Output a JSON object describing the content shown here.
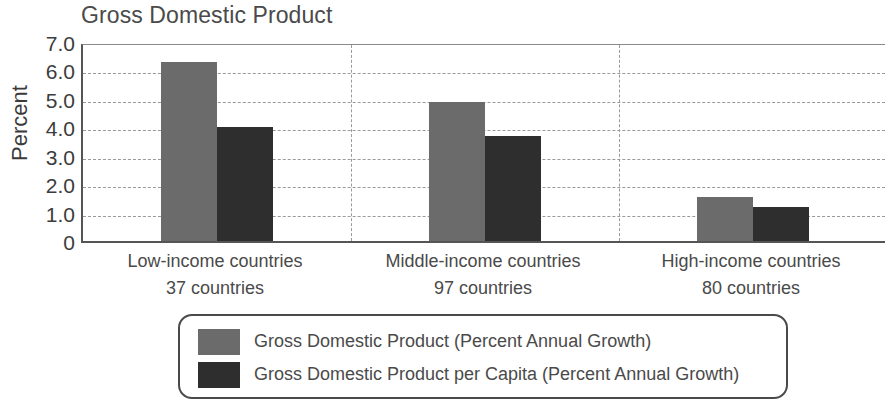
{
  "chart_data": {
    "type": "bar",
    "title": "Gross Domestic Product",
    "xlabel": "",
    "ylabel": "Percent",
    "ylim": [
      0,
      7.0
    ],
    "yticks": [
      "0",
      "1.0",
      "2.0",
      "3.0",
      "4.0",
      "5.0",
      "6.0",
      "7.0"
    ],
    "ytick_values": [
      0,
      1.0,
      2.0,
      3.0,
      4.0,
      5.0,
      6.0,
      7.0
    ],
    "grid": "horizontal-dashed",
    "legend_position": "bottom",
    "categories": [
      "Low-income countries",
      "Middle-income countries",
      "High-income countries"
    ],
    "category_sublabels": [
      "37 countries",
      "97 countries",
      "80 countries"
    ],
    "series": [
      {
        "name": "Gross Domestic Product (Percent Annual Growth)",
        "color": "#6b6b6b",
        "values": [
          6.3,
          4.9,
          1.55
        ]
      },
      {
        "name": "Gross Domestic Product per Capita (Percent Annual Growth)",
        "color": "#2e2e2e",
        "values": [
          4.0,
          3.7,
          1.2
        ]
      }
    ]
  },
  "legend": {
    "entries": [
      {
        "label": "Gross Domestic Product (Percent Annual Growth)",
        "color": "#6b6b6b"
      },
      {
        "label": "Gross Domestic Product per Capita (Percent Annual Growth)",
        "color": "#2e2e2e"
      }
    ]
  }
}
